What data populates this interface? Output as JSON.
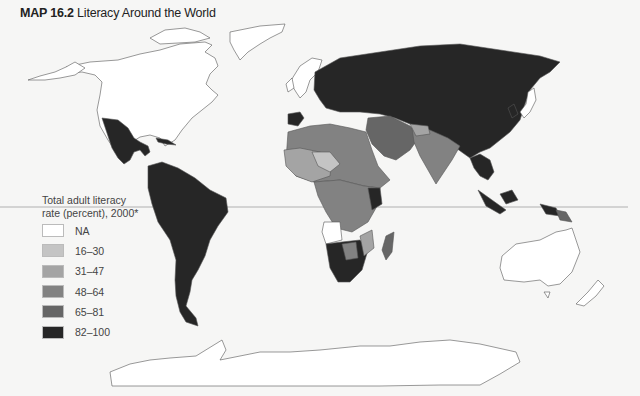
{
  "title": {
    "prefix": "MAP 16.2",
    "text": "Literacy Around the World"
  },
  "legend": {
    "title_line1": "Total adult literacy",
    "title_line2": "rate (percent), 2000*",
    "items": [
      {
        "label": "NA",
        "color": "#ffffff"
      },
      {
        "label": "16–30",
        "color": "#c4c4c4"
      },
      {
        "label": "31–47",
        "color": "#a4a4a4"
      },
      {
        "label": "48–64",
        "color": "#828282"
      },
      {
        "label": "65–81",
        "color": "#666666"
      },
      {
        "label": "82–100",
        "color": "#262626"
      }
    ]
  },
  "colors": {
    "background": "#f6f6f5",
    "outline": "#555555",
    "equator": "#b0b0b0"
  },
  "regions": [
    {
      "name": "North America (US, Canada)",
      "category": "NA"
    },
    {
      "name": "Greenland",
      "category": "NA"
    },
    {
      "name": "Western Europe",
      "category": "NA"
    },
    {
      "name": "Japan",
      "category": "NA"
    },
    {
      "name": "Australia",
      "category": "NA"
    },
    {
      "name": "New Zealand",
      "category": "NA"
    },
    {
      "name": "Antarctica",
      "category": "NA"
    },
    {
      "name": "Angola",
      "category": "NA"
    },
    {
      "name": "Mexico & Central America",
      "category": "82–100"
    },
    {
      "name": "South America",
      "category": "82–100"
    },
    {
      "name": "Russia & Eastern Europe",
      "category": "82–100"
    },
    {
      "name": "China",
      "category": "82–100"
    },
    {
      "name": "Southeast Asia",
      "category": "82–100"
    },
    {
      "name": "Southern Africa",
      "category": "82–100"
    },
    {
      "name": "North Africa",
      "category": "48–64"
    },
    {
      "name": "West Africa",
      "category": "31–47"
    },
    {
      "name": "Middle East",
      "category": "65–81"
    },
    {
      "name": "South Asia",
      "category": "48–64"
    },
    {
      "name": "Madagascar",
      "category": "65–81"
    }
  ]
}
